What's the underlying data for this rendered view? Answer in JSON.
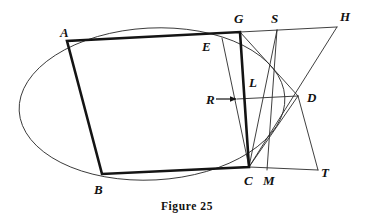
{
  "figure": {
    "caption": "Figure 25",
    "canvas": {
      "width": 374,
      "height": 222
    },
    "ink_color": "#141414",
    "thin_color": "#2a2a2a",
    "background": "#ffffff"
  },
  "labels": [
    {
      "id": "A",
      "text": "A",
      "x": 60,
      "y": 26
    },
    {
      "id": "B",
      "text": "B",
      "x": 94,
      "y": 183
    },
    {
      "id": "C",
      "text": "C",
      "x": 244,
      "y": 174
    },
    {
      "id": "D",
      "text": "D",
      "x": 307,
      "y": 91
    },
    {
      "id": "E",
      "text": "E",
      "x": 202,
      "y": 40
    },
    {
      "id": "G",
      "text": "G",
      "x": 234,
      "y": 12
    },
    {
      "id": "H",
      "text": "H",
      "x": 340,
      "y": 10
    },
    {
      "id": "L",
      "text": "L",
      "x": 249,
      "y": 76
    },
    {
      "id": "M",
      "text": "M",
      "x": 263,
      "y": 174
    },
    {
      "id": "R",
      "text": "R",
      "x": 206,
      "y": 93
    },
    {
      "id": "S",
      "text": "S",
      "x": 271,
      "y": 12
    },
    {
      "id": "T",
      "text": "T",
      "x": 321,
      "y": 166
    }
  ],
  "points": {
    "A": {
      "x": 67,
      "y": 41
    },
    "B": {
      "x": 102,
      "y": 174
    },
    "C": {
      "x": 249,
      "y": 167
    },
    "D": {
      "x": 298,
      "y": 96
    },
    "E": {
      "x": 222,
      "y": 38
    },
    "G": {
      "x": 240,
      "y": 32
    },
    "H": {
      "x": 337,
      "y": 27
    },
    "L": {
      "x": 262,
      "y": 92
    },
    "M": {
      "x": 267,
      "y": 170
    },
    "R": {
      "x": 240,
      "y": 99
    },
    "S": {
      "x": 277,
      "y": 30
    },
    "T": {
      "x": 318,
      "y": 170
    }
  },
  "ellipse": {
    "cx": 152,
    "cy": 104,
    "rx": 133,
    "ry": 76,
    "rotation_deg": -3,
    "stroke": "#2a2a2a",
    "stroke_width": 0.9
  },
  "quadrilateral": {
    "name": "ABCG",
    "vertices": [
      "A",
      "B",
      "C",
      "G"
    ],
    "stroke": "#141414",
    "stroke_width": 2.6
  },
  "segments": [
    {
      "name": "G-H",
      "from": "G",
      "to": "H",
      "weight": "thin"
    },
    {
      "name": "G-D",
      "from": "G",
      "to": "D",
      "weight": "thin"
    },
    {
      "name": "H-C",
      "from": "H",
      "to": "C",
      "weight": "thin"
    },
    {
      "name": "S-C",
      "from": "S",
      "to": "C",
      "weight": "thin"
    },
    {
      "name": "S-M",
      "from": "S",
      "to": "M",
      "weight": "thin"
    },
    {
      "name": "E-C",
      "from": "E",
      "to": "C",
      "weight": "thin"
    },
    {
      "name": "R-D",
      "from": "R",
      "to": "D",
      "weight": "thin"
    },
    {
      "name": "C-T",
      "from": "C",
      "to": "T",
      "weight": "thin"
    },
    {
      "name": "D-T",
      "from": "D",
      "to": "T",
      "weight": "thin"
    },
    {
      "name": "C-D",
      "from": "C",
      "to": "D",
      "weight": "thin"
    }
  ],
  "annotations": {
    "r_arrow": {
      "name": "r-pointer-arrow",
      "from": {
        "x": 216,
        "y": 99
      },
      "to": {
        "x": 237,
        "y": 99
      }
    }
  }
}
